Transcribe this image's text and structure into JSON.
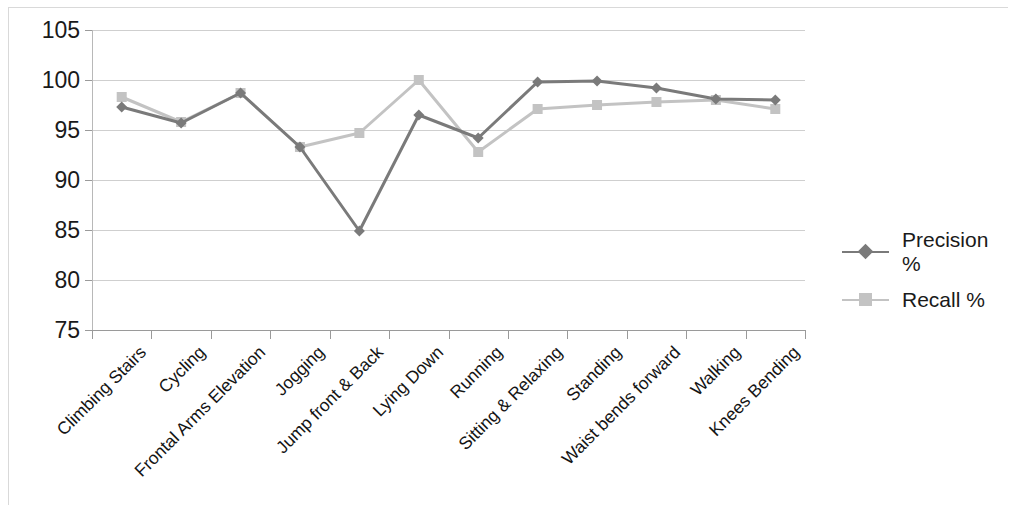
{
  "chart_data": {
    "type": "line",
    "title": "",
    "xlabel": "",
    "ylabel": "",
    "ylim": [
      75,
      105
    ],
    "yticks": [
      75,
      80,
      85,
      90,
      95,
      100,
      105
    ],
    "grid": true,
    "legend_position": "right",
    "categories": [
      "Climbing Stairs",
      "Cycling",
      "Frontal Arms Elevation",
      "Jogging",
      "Jump front & Back",
      "Lying Down",
      "Running",
      "Sitting & Relaxing",
      "Standing",
      "Waist bends forward",
      "Walking",
      "Knees Bending"
    ],
    "series": [
      {
        "name": "Precision %",
        "color": "#7a7a7a",
        "marker": "diamond",
        "values": [
          97.3,
          95.7,
          98.7,
          93.3,
          84.9,
          96.5,
          94.2,
          99.8,
          99.9,
          99.2,
          98.1,
          98.0
        ]
      },
      {
        "name": "Recall %",
        "color": "#c3c3c3",
        "marker": "square",
        "values": [
          98.3,
          95.8,
          98.7,
          93.3,
          94.7,
          100.0,
          92.8,
          97.1,
          97.5,
          97.8,
          98.0,
          97.1
        ]
      }
    ]
  },
  "legend": {
    "items": [
      {
        "label": "Precision %"
      },
      {
        "label": "Recall %"
      }
    ]
  }
}
